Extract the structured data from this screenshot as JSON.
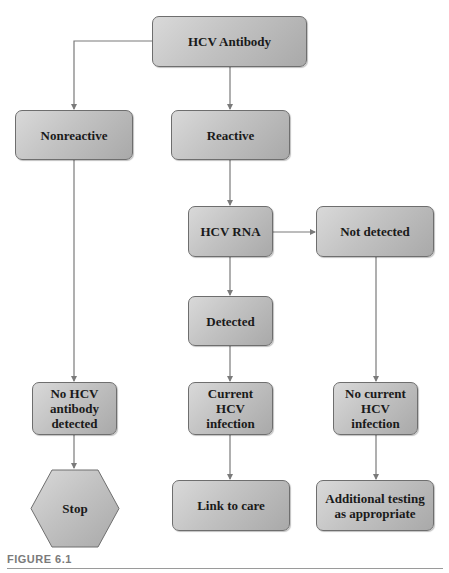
{
  "diagram": {
    "type": "flowchart",
    "nodes": {
      "hcv_antibody": "HCV Antibody",
      "nonreactive": "Nonreactive",
      "reactive": "Reactive",
      "hcv_rna": "HCV RNA",
      "not_detected": "Not detected",
      "detected": "Detected",
      "no_antibody": "No HCV\nantibody\ndetected",
      "current_infection": "Current\nHCV\ninfection",
      "no_current_infection": "No current\nHCV\ninfection",
      "stop": "Stop",
      "link_to_care": "Link to care",
      "additional_testing": "Additional testing\nas appropriate"
    },
    "edges": [
      {
        "from": "hcv_antibody",
        "to": "nonreactive"
      },
      {
        "from": "hcv_antibody",
        "to": "reactive"
      },
      {
        "from": "reactive",
        "to": "hcv_rna"
      },
      {
        "from": "hcv_rna",
        "to": "not_detected"
      },
      {
        "from": "hcv_rna",
        "to": "detected"
      },
      {
        "from": "nonreactive",
        "to": "no_antibody"
      },
      {
        "from": "no_antibody",
        "to": "stop"
      },
      {
        "from": "detected",
        "to": "current_infection"
      },
      {
        "from": "current_infection",
        "to": "link_to_care"
      },
      {
        "from": "not_detected",
        "to": "no_current_infection"
      },
      {
        "from": "no_current_infection",
        "to": "additional_testing"
      }
    ],
    "colors": {
      "node_fill_light": "#d9d9d9",
      "node_fill_dark": "#a9a9a9",
      "node_border": "#6e6e6e",
      "edge": "#7a7a7a"
    }
  },
  "caption": "FIGURE 6.1"
}
